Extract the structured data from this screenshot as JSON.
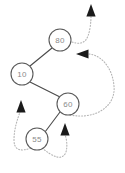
{
  "diagram": {
    "canvas": {
      "width": 125,
      "height": 173,
      "background": "#ffffff"
    },
    "style": {
      "node_fill": "#ffffff",
      "node_stroke": "#5a5a5a",
      "node_text_color": "#8a8a8a",
      "edge_color": "#4a4a4a",
      "trace_color": "#b4b4b4",
      "arrowhead_color": "#1a1a1a",
      "node_radius": 11
    },
    "nodes": [
      {
        "id": "n80",
        "label": "80",
        "cx": 60,
        "cy": 40,
        "r": 11,
        "role": "root"
      },
      {
        "id": "n10",
        "label": "10",
        "cx": 22,
        "cy": 74,
        "r": 11,
        "role": "left-child-of-root"
      },
      {
        "id": "n60",
        "label": "60",
        "cx": 68,
        "cy": 104,
        "r": 11,
        "role": "right-child-of-10"
      },
      {
        "id": "n55",
        "label": "55",
        "cx": 37,
        "cy": 139,
        "r": 11,
        "role": "left-child-of-60"
      }
    ],
    "edges": [
      {
        "id": "e80-10",
        "from": "n80",
        "to": "n10",
        "x1": 52,
        "y1": 48,
        "x2": 30,
        "y2": 66,
        "style": "solid"
      },
      {
        "id": "e10-60",
        "from": "n10",
        "to": "n60",
        "x1": 30,
        "y1": 82,
        "x2": 60,
        "y2": 97,
        "style": "solid"
      },
      {
        "id": "e60-55",
        "from": "n60",
        "to": "n55",
        "x1": 60,
        "y1": 112,
        "x2": 45,
        "y2": 132,
        "style": "solid"
      }
    ],
    "traces": [
      {
        "id": "trace-exit-top",
        "description": "dotted path leaving node 80 to the upper right, arrow pointing up out of the diagram",
        "path": "M 72 42 C 84 46 88 40 90 28 C 91 22 91 18 91 16",
        "arrow": {
          "x": 91,
          "y": 6,
          "direction": "up"
        }
      },
      {
        "id": "trace-loop-right",
        "description": "large dotted loop from the right of node 60 sweeping right and up, arrow pointing left toward node 80",
        "path": "M 70 115 C 96 120 116 106 114 86 C 112 64 98 54 88 54",
        "arrow": {
          "x": 78,
          "y": 54,
          "direction": "left"
        }
      },
      {
        "id": "trace-up-left",
        "description": "dotted path from under node 55 curving left and up, arrow pointing up toward node 10",
        "path": "M 31 148 C 20 152 14 150 14 140 C 14 128 18 118 20 112",
        "arrow": {
          "x": 21,
          "y": 102,
          "direction": "up"
        }
      },
      {
        "id": "trace-up-middle",
        "description": "dotted path from under node 55 sweeping right along the bottom and up, arrow pointing up toward node 60",
        "path": "M 42 148 C 52 156 62 162 66 152 C 68 144 66 138 65 134",
        "arrow": {
          "x": 65,
          "y": 125,
          "direction": "up"
        }
      }
    ]
  }
}
